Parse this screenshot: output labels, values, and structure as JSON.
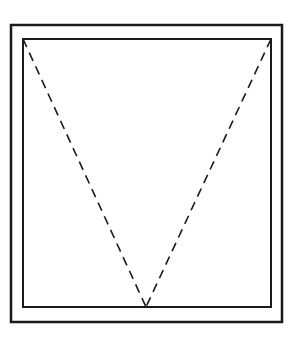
{
  "diagram": {
    "type": "window-elevation-symbol",
    "colors": {
      "background": "#ffffff",
      "line": "#1a1a1a"
    },
    "outer_frame": {
      "x": 11,
      "y": 25,
      "width": 271,
      "height": 297
    },
    "inner_sash": {
      "x": 23,
      "y": 39,
      "width": 248,
      "height": 268
    },
    "swing_lines": [
      {
        "x1": 23,
        "y1": 39,
        "x2": 146,
        "y2": 307
      },
      {
        "x1": 271,
        "y1": 39,
        "x2": 146,
        "y2": 307
      }
    ]
  }
}
